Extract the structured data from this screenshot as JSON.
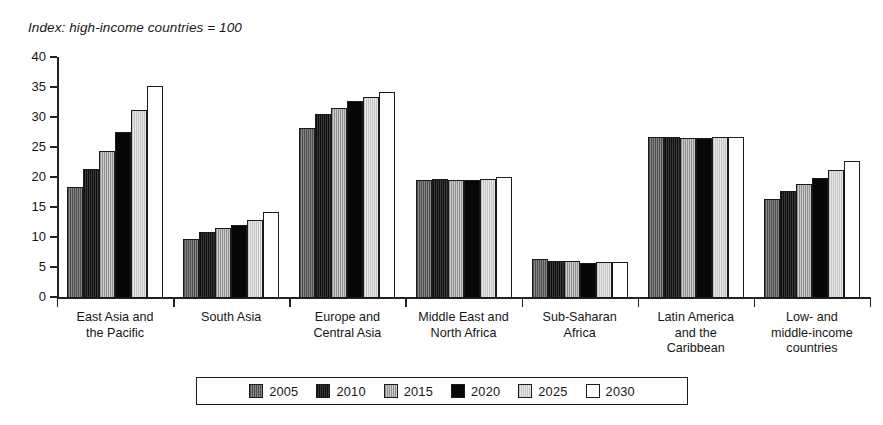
{
  "chart_data": {
    "type": "bar",
    "title": "Index: high-income countries = 100",
    "xlabel": "",
    "ylabel": "",
    "ylim": [
      0,
      40
    ],
    "ytick_step": 5,
    "yticks": [
      40,
      35,
      30,
      25,
      20,
      15,
      10,
      5,
      0
    ],
    "grid": false,
    "legend_position": "bottom",
    "categories": [
      "East Asia and the Pacific",
      "South Asia",
      "Europe and Central Asia",
      "Middle East and North Africa",
      "Sub-Saharan Africa",
      "Latin America and the Caribbean",
      "Low- and middle-income countries"
    ],
    "category_lines": [
      [
        "East Asia and",
        "the Pacific"
      ],
      [
        "South Asia"
      ],
      [
        "Europe and",
        "Central Asia"
      ],
      [
        "Middle East and",
        "North Africa"
      ],
      [
        "Sub-Saharan",
        "Africa"
      ],
      [
        "Latin America",
        "and the",
        "Caribbean"
      ],
      [
        "Low- and",
        "middle-income",
        "countries"
      ]
    ],
    "series": [
      {
        "name": "2005",
        "color": "#6f6f6f",
        "values": [
          18.5,
          9.8,
          28.3,
          19.7,
          6.5,
          26.8,
          16.5
        ]
      },
      {
        "name": "2010",
        "color": "#1d1d1d",
        "values": [
          21.5,
          11.0,
          30.7,
          19.8,
          6.2,
          26.8,
          17.9
        ]
      },
      {
        "name": "2015",
        "color": "#b4b4b4",
        "values": [
          24.5,
          11.6,
          31.7,
          19.7,
          6.2,
          26.7,
          19.0
        ]
      },
      {
        "name": "2020",
        "color": "#070707",
        "values": [
          27.7,
          12.2,
          32.9,
          19.7,
          5.9,
          26.6,
          20.0
        ]
      },
      {
        "name": "2025",
        "color": "#d9d9d9",
        "values": [
          31.3,
          13.0,
          33.5,
          19.8,
          6.0,
          26.8,
          21.4
        ]
      },
      {
        "name": "2030",
        "color": "#ffffff",
        "values": [
          35.4,
          14.4,
          34.4,
          20.2,
          6.0,
          26.9,
          22.8
        ]
      }
    ]
  },
  "legend": {
    "items": [
      {
        "label": "2005"
      },
      {
        "label": "2010"
      },
      {
        "label": "2015"
      },
      {
        "label": "2020"
      },
      {
        "label": "2025"
      },
      {
        "label": "2030"
      }
    ]
  }
}
